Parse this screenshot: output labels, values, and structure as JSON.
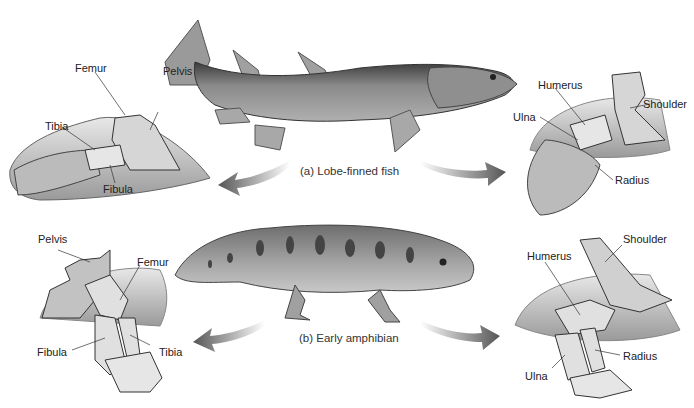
{
  "figure": {
    "style": "grayscale illustration",
    "colors": {
      "background": "#ffffff",
      "bone": "#d9d9d9",
      "outline": "#444444",
      "body": "#7a7a7a",
      "arrow": "#666666",
      "text": "#222222"
    },
    "captions": {
      "fish": "(a) Lobe-finned fish",
      "amphibian": "(b) Early amphibian"
    },
    "fish_hindlimb_labels": {
      "femur": "Femur",
      "pelvis": "Pelvis",
      "tibia": "Tibia",
      "fibula": "Fibula"
    },
    "fish_forelimb_labels": {
      "humerus": "Humerus",
      "ulna": "Ulna",
      "shoulder": "Shoulder",
      "radius": "Radius"
    },
    "amphibian_hindlimb_labels": {
      "pelvis": "Pelvis",
      "femur": "Femur",
      "fibula": "Fibula",
      "tibia": "Tibia"
    },
    "amphibian_forelimb_labels": {
      "humerus": "Humerus",
      "shoulder": "Shoulder",
      "radius": "Radius",
      "ulna": "Ulna"
    }
  }
}
